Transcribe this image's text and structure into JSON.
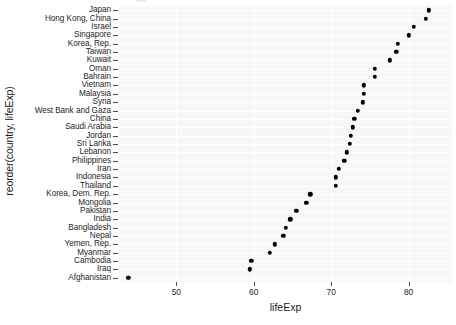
{
  "chart_data": {
    "type": "scatter",
    "title": "",
    "xlabel": "lifeExp",
    "ylabel": "reorder(country, lifeExp)",
    "xlim": [
      42.6,
      85.6
    ],
    "xticks": [
      50,
      60,
      70,
      80
    ],
    "xtick_labels": [
      "50",
      "60",
      "70",
      "80"
    ],
    "grid": true,
    "legend": "none",
    "point_color": "#000000",
    "panel_color": "#f7f7f8",
    "categories": [
      "Japan",
      "Hong Kong, China",
      "Israel",
      "Singapore",
      "Korea, Rep.",
      "Taiwan",
      "Kuwait",
      "Oman",
      "Bahrain",
      "Vietnam",
      "Malaysia",
      "Syria",
      "West Bank and Gaza",
      "China",
      "Saudi Arabia",
      "Jordan",
      "Sri Lanka",
      "Lebanon",
      "Philippines",
      "Iran",
      "Indonesia",
      "Thailand",
      "Korea, Dem. Rep.",
      "Mongolia",
      "Pakistan",
      "India",
      "Bangladesh",
      "Nepal",
      "Yemen, Rep.",
      "Myanmar",
      "Cambodia",
      "Iraq",
      "Afghanistan"
    ],
    "values": [
      82.6,
      82.2,
      80.7,
      80.0,
      78.6,
      78.4,
      77.6,
      75.6,
      75.6,
      74.2,
      74.2,
      74.1,
      73.4,
      73.0,
      72.8,
      72.5,
      72.4,
      71.99,
      71.7,
      71.0,
      70.6,
      70.6,
      67.3,
      66.8,
      65.5,
      64.7,
      64.1,
      63.8,
      62.7,
      62.1,
      59.7,
      59.5,
      43.8
    ]
  }
}
